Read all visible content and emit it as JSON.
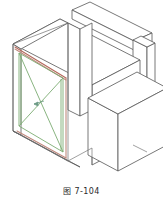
{
  "figure": {
    "caption": "图 7-104",
    "caption_label": "图",
    "caption_number": "7-104",
    "background_color": "#ffffff",
    "title_alt": "Isometric drawing of wall-mounted duct opening with X-braced frame"
  },
  "colors": {
    "outline": "#4a4a4a",
    "outline_light": "#8a8a8a",
    "brace_green": "#7cab72",
    "frame_green": "#79a96e",
    "frame_salmon": "#c08a7e",
    "frame_red": "#b4695c",
    "face_fill": "#ffffff",
    "caption_text": "#2b2b2b"
  },
  "parts": [
    {
      "id": "top-beam",
      "name": "Top beam / ridge cap",
      "style": "solid outline"
    },
    {
      "id": "right-pillar",
      "name": "Vertical pillar at right",
      "style": "solid outline"
    },
    {
      "id": "main-body",
      "name": "Main rectangular duct body",
      "style": "solid outline"
    },
    {
      "id": "front-flange",
      "name": "Front flange plate",
      "style": "solid outline"
    },
    {
      "id": "inner-frame",
      "name": "Inner frame (salmon/red edges)",
      "style": "colored outline"
    },
    {
      "id": "brace-panel",
      "name": "X-braced panel (green diagonals)",
      "style": "green lines"
    },
    {
      "id": "side-box",
      "name": "Attached side box on right face",
      "style": "solid outline"
    },
    {
      "id": "center-marker",
      "name": "Center crossing marker / arrow",
      "style": "small arrow"
    }
  ],
  "geometry": {
    "front_frame_outer": [
      [
        10,
        45
      ],
      [
        70,
        78
      ],
      [
        70,
        160
      ],
      [
        10,
        128
      ]
    ],
    "front_frame_inner": [
      [
        19,
        55
      ],
      [
        63,
        79
      ],
      [
        63,
        150
      ],
      [
        19,
        120
      ]
    ],
    "brace_diagonal_a": [
      [
        19,
        55
      ],
      [
        63,
        150
      ]
    ],
    "brace_diagonal_b": [
      [
        63,
        79
      ],
      [
        19,
        120
      ]
    ],
    "center_point": [
      41,
      102
    ],
    "top_face": [
      [
        10,
        45
      ],
      [
        58,
        20
      ],
      [
        118,
        53
      ],
      [
        70,
        78
      ]
    ],
    "side_box_front": [
      [
        88,
        98
      ],
      [
        120,
        82
      ],
      [
        120,
        137
      ],
      [
        88,
        152
      ]
    ],
    "pillar_top": [
      [
        134,
        23
      ],
      [
        152,
        31
      ],
      [
        152,
        135
      ],
      [
        134,
        127
      ]
    ],
    "beam_top": [
      [
        60,
        8
      ],
      [
        92,
        0
      ],
      [
        152,
        31
      ],
      [
        118,
        40
      ]
    ]
  }
}
